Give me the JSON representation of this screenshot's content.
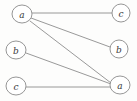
{
  "diagram": {
    "type": "graph",
    "width": 137,
    "height": 101,
    "background_color": "#fdfdfc",
    "node_fill_color": "#ffffff",
    "node_stroke_color": "#8a8a8a",
    "edge_color": "#8d8d8d",
    "label_color": "#3a3a3a",
    "nodes": [
      {
        "id": "left-a",
        "label": "a",
        "cx": 22,
        "cy": 14,
        "rx": 10,
        "ry": 9,
        "column": "left",
        "row": 0
      },
      {
        "id": "left-b",
        "label": "b",
        "cx": 16,
        "cy": 50,
        "rx": 10,
        "ry": 9,
        "column": "left",
        "row": 1
      },
      {
        "id": "left-c",
        "label": "c",
        "cx": 16,
        "cy": 86,
        "rx": 10,
        "ry": 9,
        "column": "left",
        "row": 2
      },
      {
        "id": "right-c",
        "label": "c",
        "cx": 121,
        "cy": 13,
        "rx": 9,
        "ry": 9,
        "column": "right",
        "row": 0
      },
      {
        "id": "right-b",
        "label": "b",
        "cx": 119,
        "cy": 49,
        "rx": 9,
        "ry": 9,
        "column": "right",
        "row": 1
      },
      {
        "id": "right-a",
        "label": "a",
        "cx": 120,
        "cy": 85,
        "rx": 10,
        "ry": 9,
        "column": "right",
        "row": 2
      }
    ],
    "edges": [
      {
        "id": "edge-a-c",
        "source": "left-a",
        "target": "right-c",
        "x1": 32,
        "y1": 13,
        "x2": 112,
        "y2": 13
      },
      {
        "id": "edge-a-b",
        "source": "left-a",
        "target": "right-b",
        "x1": 31,
        "y1": 18,
        "x2": 110,
        "y2": 47
      },
      {
        "id": "edge-a-a",
        "source": "left-a",
        "target": "right-a",
        "x1": 30,
        "y1": 21,
        "x2": 111,
        "y2": 83
      },
      {
        "id": "edge-b-a",
        "source": "left-b",
        "target": "right-a",
        "x1": 26,
        "y1": 53,
        "x2": 111,
        "y2": 84
      },
      {
        "id": "edge-c-a",
        "source": "left-c",
        "target": "right-a",
        "x1": 26,
        "y1": 87,
        "x2": 110,
        "y2": 87
      }
    ]
  }
}
